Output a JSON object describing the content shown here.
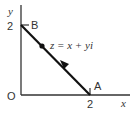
{
  "diagram": {
    "type": "argand-diagram",
    "axes": {
      "x_label": "x",
      "y_label": "y",
      "origin_label": "O",
      "x_tick": "2",
      "y_tick": "2"
    },
    "points": [
      {
        "name": "A",
        "label": "A",
        "coords": [
          2,
          0
        ]
      },
      {
        "name": "B",
        "label": "B",
        "coords": [
          0,
          2
        ]
      }
    ],
    "segment": {
      "from": "A",
      "to": "B",
      "direction": "A to B"
    },
    "moving_point": {
      "label": "z = x + yi"
    },
    "colors": {
      "line": "#111111",
      "axis": "#333333",
      "text": "#333333"
    }
  }
}
